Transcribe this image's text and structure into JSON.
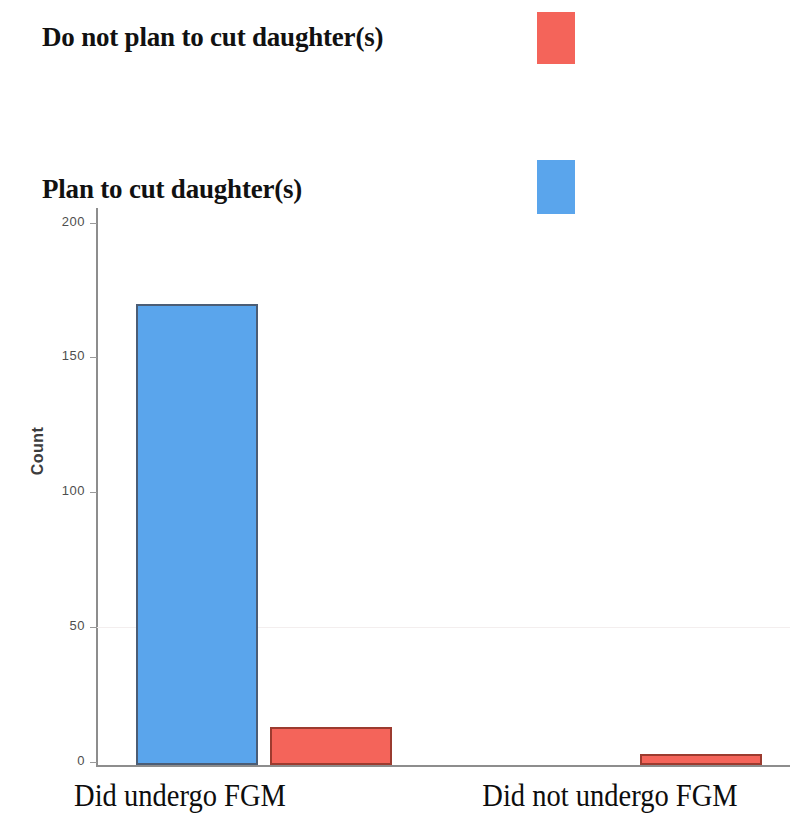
{
  "legend": {
    "items": [
      {
        "label": "Do not plan to cut daughter(s)",
        "color": "#f4645a",
        "swatch_name": "red"
      },
      {
        "label": "Plan to cut daughter(s)",
        "color": "#5aa5ec",
        "swatch_name": "blue"
      }
    ]
  },
  "axis": {
    "y_title": "Count",
    "y_ticks": [
      "200",
      "150",
      "100",
      "50",
      "0"
    ],
    "x_categories": [
      "Did undergo FGM",
      "Did not undergo FGM"
    ]
  },
  "chart_data": {
    "type": "bar",
    "title": "",
    "xlabel": "",
    "ylabel": "Count",
    "categories": [
      "Did undergo FGM",
      "Did not undergo FGM"
    ],
    "series": [
      {
        "name": "Plan to cut daughter(s)",
        "color": "#5aa5ec",
        "values": [
          170,
          0
        ]
      },
      {
        "name": "Do not plan to cut daughter(s)",
        "color": "#f4645a",
        "values": [
          14,
          4
        ]
      }
    ],
    "ylim": [
      0,
      210
    ],
    "yticks": [
      0,
      50,
      100,
      150,
      200
    ],
    "grid": "faint-horizontal-at-50",
    "legend_position": "top-right-swatches"
  }
}
